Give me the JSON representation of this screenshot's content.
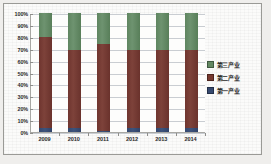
{
  "chart_data": {
    "type": "bar",
    "subtype": "100% stacked column",
    "title": "",
    "xlabel": "",
    "ylabel": "",
    "categories": [
      "2009",
      "2010",
      "2011",
      "2012",
      "2013",
      "2014"
    ],
    "series": [
      {
        "name": "第一产业",
        "color": "#36496f",
        "values": [
          3,
          3,
          1,
          3,
          3,
          3
        ]
      },
      {
        "name": "第二产业",
        "color": "#77392f",
        "values": [
          77,
          66,
          73,
          66,
          66,
          66
        ]
      },
      {
        "name": "第三产业",
        "color": "#628761",
        "values": [
          20,
          31,
          26,
          31,
          31,
          31
        ]
      }
    ],
    "stack_tops": {
      "第一产业": [
        3,
        3,
        1,
        3,
        3,
        3
      ],
      "第二产业": [
        80,
        69,
        74,
        69,
        69,
        69
      ],
      "第三产业": [
        100,
        100,
        100,
        100,
        100,
        100
      ]
    },
    "ylim": [
      0,
      100
    ],
    "yticks": [
      "0%",
      "10%",
      "20%",
      "30%",
      "40%",
      "50%",
      "60%",
      "70%",
      "80%",
      "90%",
      "100%"
    ],
    "ytick_values": [
      0,
      10,
      20,
      30,
      40,
      50,
      60,
      70,
      80,
      90,
      100
    ],
    "grid": true,
    "grid_axis": "y",
    "legend_position": "right"
  },
  "legend": {
    "items": [
      {
        "label": "第三产业",
        "color": "#628761"
      },
      {
        "label": "第二产业",
        "color": "#77392f"
      },
      {
        "label": "第一产业",
        "color": "#36496f"
      }
    ]
  },
  "colors": {
    "series_tertiary": "#628761",
    "series_secondary": "#77392f",
    "series_primary": "#36496f",
    "gridline": "#c9cdd2",
    "axis": "#a8a8a4",
    "plot_background": "#fdfdfc",
    "page_background": "#efeeec",
    "frame_border": "#9a9a96"
  }
}
